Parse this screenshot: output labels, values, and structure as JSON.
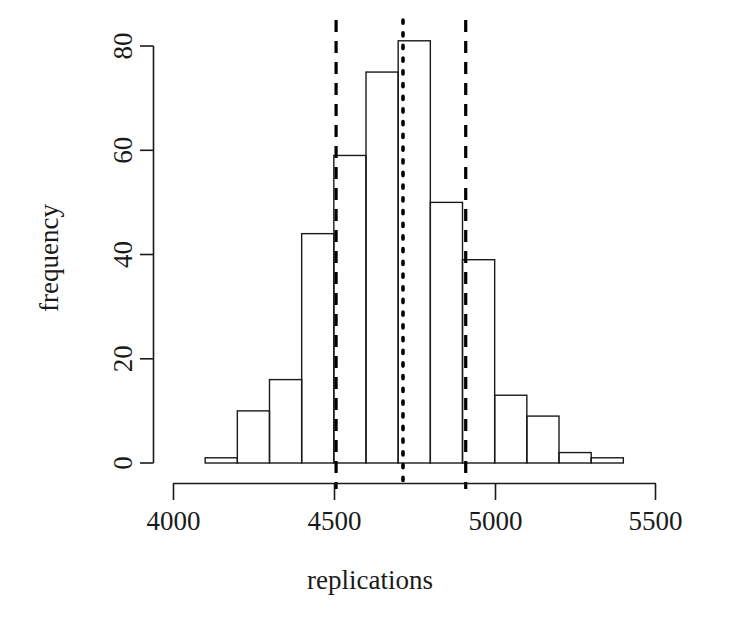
{
  "chart_data": {
    "type": "bar",
    "title": "",
    "subtitle": "",
    "xlabel": "replications",
    "ylabel": "frequency",
    "xlim": [
      4000,
      5500
    ],
    "ylim": [
      0,
      81
    ],
    "grid": false,
    "legend": "none",
    "xtick_labels": [
      "4000",
      "4500",
      "5000",
      "5500"
    ],
    "xtick_values": [
      4000,
      4500,
      5000,
      5500
    ],
    "ytick_labels": [
      "0",
      "20",
      "40",
      "60",
      "80"
    ],
    "ytick_values": [
      0,
      20,
      40,
      60,
      80
    ],
    "bin_width": 100,
    "bin_edges": [
      4100,
      4200,
      4300,
      4400,
      4500,
      4600,
      4700,
      4800,
      4900,
      5000,
      5100,
      5200,
      5300,
      5400
    ],
    "categories": [
      "4100-4200",
      "4200-4300",
      "4300-4400",
      "4400-4500",
      "4500-4600",
      "4600-4700",
      "4700-4800",
      "4800-4900",
      "4900-5000",
      "5000-5100",
      "5100-5200",
      "5200-5300",
      "5300-5400"
    ],
    "values": [
      1,
      10,
      16,
      44,
      59,
      75,
      81,
      50,
      39,
      13,
      9,
      2,
      1
    ],
    "annotations": [
      {
        "name": "lower-bound-line",
        "style": "dashed",
        "x": 4507,
        "label": ""
      },
      {
        "name": "center-line",
        "style": "dotted",
        "x": 4715,
        "label": ""
      },
      {
        "name": "upper-bound-line",
        "style": "dashed",
        "x": 4910,
        "label": ""
      }
    ],
    "colors": {
      "bar_stroke": "#1a1a1a",
      "bar_fill": "none",
      "axis": "#1a1a1a",
      "annotation": "#000000"
    }
  },
  "axes": {
    "x_title": "replications",
    "y_title": "frequency"
  }
}
